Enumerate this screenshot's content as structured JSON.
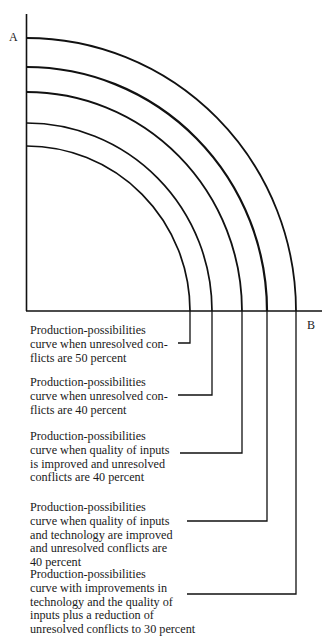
{
  "axes": {
    "y_label": "A",
    "x_label": "B"
  },
  "curves": [
    {
      "id": 1,
      "y_intercept": 146,
      "x_intercept": 190,
      "leader_y": 343,
      "text_top": 324,
      "lines": [
        "Production-possibilities",
        "curve when unresolved con-",
        "flicts are 50 percent"
      ]
    },
    {
      "id": 2,
      "y_intercept": 123,
      "x_intercept": 212,
      "leader_y": 395,
      "text_top": 376,
      "lines": [
        "Production-possibilities",
        "curve when unresolved con-",
        "flicts are 40 percent"
      ]
    },
    {
      "id": 3,
      "y_intercept": 92,
      "x_intercept": 242,
      "leader_y": 453,
      "text_top": 430,
      "lines": [
        "Production-possibilities",
        "curve when quality of inputs",
        "is improved and unresolved",
        "conflicts are 40 percent"
      ]
    },
    {
      "id": 4,
      "y_intercept": 67,
      "x_intercept": 267,
      "leader_y": 521,
      "text_top": 501,
      "lines": [
        "Production-possibilities",
        "curve when quality of inputs",
        "and technology are improved",
        "and unresolved conflicts are",
        "40 percent"
      ]
    },
    {
      "id": 5,
      "y_intercept": 38,
      "x_intercept": 296,
      "leader_y": 594,
      "text_top": 568,
      "lines": [
        "Production-possibilities",
        "curve with improvements in",
        "technology and the quality of",
        "inputs plus a reduction of",
        "unresolved conflicts to 30 percent"
      ]
    }
  ]
}
